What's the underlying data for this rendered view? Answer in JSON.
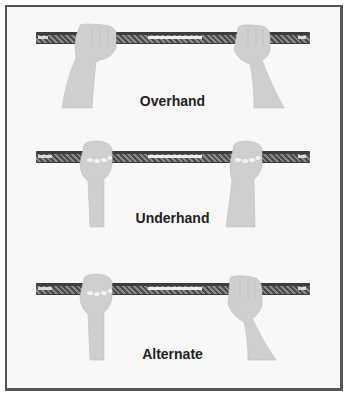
{
  "figure": {
    "panels": [
      {
        "label": "Overhand",
        "left_hand": "overhand-fist",
        "right_hand": "overhand-fist"
      },
      {
        "label": "Underhand",
        "left_hand": "underhand-fist",
        "right_hand": "underhand-fist"
      },
      {
        "label": "Alternate",
        "left_hand": "underhand-fist",
        "right_hand": "overhand-fist"
      }
    ]
  },
  "colors": {
    "skin": "#cfcfcf",
    "bar_dark": "#4a4a4a",
    "bar_light": "#e0e0e0",
    "border": "#555555",
    "background": "#f8f8f8",
    "text": "#222222"
  }
}
